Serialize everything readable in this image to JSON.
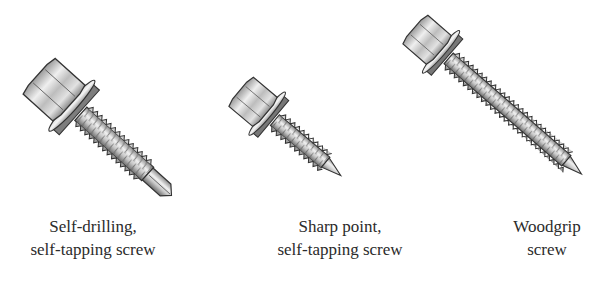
{
  "figure": {
    "screws": [
      {
        "id": "self-drilling",
        "caption_lines": [
          "Self-drilling,",
          "self-tapping screw"
        ],
        "tip": "drill point"
      },
      {
        "id": "sharp-point",
        "caption_lines": [
          "Sharp point,",
          "self-tapping screw"
        ],
        "tip": "sharp point"
      },
      {
        "id": "woodgrip",
        "caption_lines": [
          "Woodgrip",
          "screw"
        ],
        "tip": "sharp point"
      }
    ],
    "colors": {
      "background": "#ffffff",
      "ink": "#2b2b2b",
      "metal_light": "#e6e6e6",
      "metal_mid": "#b5b5b5",
      "metal_dark": "#6e6e6e"
    }
  }
}
